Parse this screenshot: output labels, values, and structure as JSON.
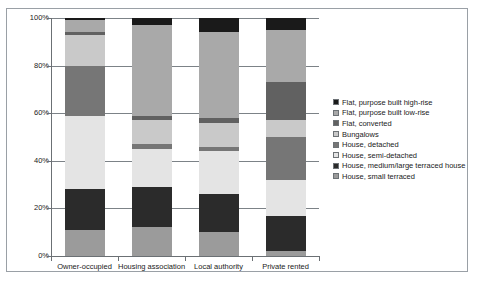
{
  "chart_data": {
    "type": "bar",
    "subtype": "stacked-100-percent",
    "title": "",
    "xlabel": "",
    "ylabel": "",
    "ylim": [
      0,
      100
    ],
    "y_ticks": [
      "0%",
      "20%",
      "40%",
      "60%",
      "80%",
      "100%"
    ],
    "y_tick_values": [
      0,
      20,
      40,
      60,
      80,
      100
    ],
    "grid": true,
    "legend_position": "right",
    "categories": [
      "Owner-occupied",
      "Housing association",
      "Local authority",
      "Private rented"
    ],
    "series": [
      {
        "name": "Flat, purpose built high-rise",
        "color": "#1a1a1a",
        "values": [
          1,
          3,
          6,
          5
        ]
      },
      {
        "name": "Flat, purpose built low-rise",
        "color": "#a9a9a9",
        "values": [
          5,
          38,
          36,
          22
        ]
      },
      {
        "name": "Flat, converted",
        "color": "#616161",
        "values": [
          1,
          2,
          2,
          16
        ]
      },
      {
        "name": "Bungalows",
        "color": "#c9c9c9",
        "values": [
          13,
          10,
          10,
          7
        ]
      },
      {
        "name": "House, detached",
        "color": "#767676",
        "values": [
          21,
          2,
          2,
          18
        ]
      },
      {
        "name": "House, semi-detached",
        "color": "#e4e4e4",
        "values": [
          31,
          16,
          18,
          15
        ]
      },
      {
        "name": "House, medium/large terraced house",
        "color": "#2b2b2b",
        "values": [
          17,
          17,
          16,
          15
        ]
      },
      {
        "name": "House, small terraced",
        "color": "#9b9b9b",
        "values": [
          11,
          12,
          10,
          2
        ]
      }
    ]
  },
  "legend": {
    "items": [
      "Flat, purpose built high-rise",
      "Flat, purpose built low-rise",
      "Flat, converted",
      "Bungalows",
      "House, detached",
      "House, semi-detached",
      "House, medium/large terraced house",
      "House, small terraced"
    ]
  },
  "colors": {
    "frame_border": "#9aa0a6",
    "axis": "#6b7074",
    "gridline": "#7c8287",
    "background": "#ffffff",
    "text": "#1a1a1a"
  }
}
